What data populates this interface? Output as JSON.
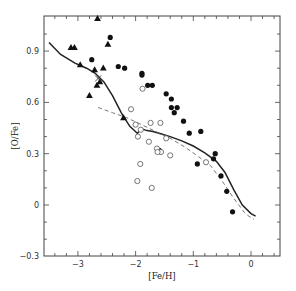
{
  "chart_data": {
    "type": "scatter",
    "title": "",
    "xlabel": "[Fe/H]",
    "ylabel": "[O/Fe]",
    "xlim": [
      -3.6,
      0.5
    ],
    "ylim": [
      -0.3,
      1.1
    ],
    "xticks": [
      -3,
      -2,
      -1,
      0
    ],
    "xtick_labels": [
      "−3",
      "−2",
      "−1",
      "0"
    ],
    "yticks": [
      -0.3,
      0,
      0.3,
      0.6,
      0.9
    ],
    "ytick_labels": [
      "−0.3",
      "0",
      "0.3",
      "0.6",
      "0.9"
    ],
    "grid": false,
    "legend": null,
    "series": [
      {
        "name": "filled-triangles",
        "marker": "triangle-filled",
        "points": [
          [
            -2.66,
            1.09
          ],
          [
            -3.12,
            0.92
          ],
          [
            -3.06,
            0.92
          ],
          [
            -2.48,
            0.94
          ],
          [
            -2.96,
            0.82
          ],
          [
            -2.56,
            0.8
          ],
          [
            -2.71,
            0.79
          ],
          [
            -2.67,
            0.7
          ],
          [
            -2.8,
            0.64
          ],
          [
            -2.21,
            0.51
          ],
          [
            -2.62,
            0.72
          ]
        ]
      },
      {
        "name": "filled-circles",
        "marker": "circle-filled",
        "points": [
          [
            -2.44,
            0.98
          ],
          [
            -2.76,
            0.85
          ],
          [
            -2.3,
            0.81
          ],
          [
            -2.19,
            0.8
          ],
          [
            -1.89,
            0.77
          ],
          [
            -1.89,
            0.76
          ],
          [
            -1.79,
            0.7
          ],
          [
            -1.71,
            0.7
          ],
          [
            -1.47,
            0.65
          ],
          [
            -1.38,
            0.62
          ],
          [
            -1.38,
            0.57
          ],
          [
            -1.28,
            0.57
          ],
          [
            -1.33,
            0.54
          ],
          [
            -1.17,
            0.49
          ],
          [
            -1.07,
            0.42
          ],
          [
            -0.87,
            0.43
          ],
          [
            -1.59,
            0.32
          ],
          [
            -0.65,
            0.27
          ],
          [
            -0.62,
            0.3
          ],
          [
            -0.93,
            0.24
          ],
          [
            -0.52,
            0.17
          ],
          [
            -0.42,
            0.08
          ],
          [
            -0.32,
            -0.04
          ]
        ]
      },
      {
        "name": "open-circles",
        "marker": "circle-open",
        "points": [
          [
            -1.88,
            0.68
          ],
          [
            -2.08,
            0.56
          ],
          [
            -1.74,
            0.48
          ],
          [
            -1.91,
            0.44
          ],
          [
            -1.57,
            0.48
          ],
          [
            -1.47,
            0.39
          ],
          [
            -2.0,
            0.47
          ],
          [
            -1.96,
            0.4
          ],
          [
            -1.77,
            0.37
          ],
          [
            -1.63,
            0.33
          ],
          [
            -1.56,
            0.31
          ],
          [
            -1.4,
            0.29
          ],
          [
            -1.92,
            0.24
          ],
          [
            -1.97,
            0.14
          ],
          [
            -1.72,
            0.1
          ],
          [
            -0.78,
            0.25
          ],
          [
            -1.62,
            0.31
          ]
        ]
      },
      {
        "name": "cross",
        "marker": "cross",
        "points": [
          [
            -2.65,
            0.74
          ]
        ]
      },
      {
        "name": "model-solid",
        "style": "solid-line",
        "points": [
          [
            -3.5,
            0.95
          ],
          [
            -3.3,
            0.88
          ],
          [
            -3.05,
            0.83
          ],
          [
            -2.85,
            0.8
          ],
          [
            -2.7,
            0.77
          ],
          [
            -2.55,
            0.72
          ],
          [
            -2.4,
            0.64
          ],
          [
            -2.25,
            0.54
          ],
          [
            -2.1,
            0.46
          ],
          [
            -1.97,
            0.42
          ],
          [
            -1.9,
            0.445
          ],
          [
            -1.8,
            0.435
          ],
          [
            -1.7,
            0.43
          ],
          [
            -1.55,
            0.415
          ],
          [
            -1.4,
            0.4
          ],
          [
            -1.2,
            0.375
          ],
          [
            -1.0,
            0.345
          ],
          [
            -0.8,
            0.305
          ],
          [
            -0.6,
            0.255
          ],
          [
            -0.45,
            0.19
          ],
          [
            -0.3,
            0.09
          ],
          [
            -0.15,
            0.0
          ],
          [
            0.0,
            -0.05
          ],
          [
            0.08,
            -0.065
          ]
        ]
      },
      {
        "name": "model-dashed",
        "style": "dashed-line",
        "points": [
          [
            -2.65,
            0.57
          ],
          [
            -2.4,
            0.54
          ],
          [
            -2.15,
            0.51
          ],
          [
            -1.9,
            0.47
          ],
          [
            -1.65,
            0.43
          ],
          [
            -1.4,
            0.39
          ],
          [
            -1.15,
            0.34
          ],
          [
            -0.9,
            0.28
          ],
          [
            -0.7,
            0.23
          ],
          [
            -0.5,
            0.14
          ],
          [
            -0.3,
            0.04
          ],
          [
            -0.1,
            -0.05
          ],
          [
            0.05,
            -0.085
          ]
        ]
      }
    ]
  }
}
